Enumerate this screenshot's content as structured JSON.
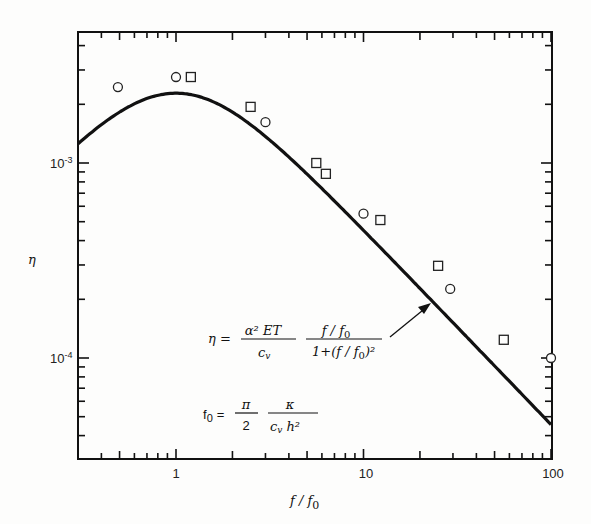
{
  "chart_data": {
    "type": "scatter",
    "title": "",
    "xlabel": "f / f0",
    "ylabel": "η",
    "xscale": "log",
    "yscale": "log",
    "xlim": [
      0.3,
      100
    ],
    "ylim": [
      3e-05,
      0.0047
    ],
    "x_tick_labels": [
      "1",
      "10",
      "100"
    ],
    "y_tick_labels": [
      "10^-3",
      "10^-4"
    ],
    "grid": false,
    "legend": null,
    "series": [
      {
        "name": "circles",
        "marker": "circle",
        "x": [
          0.49,
          1.0,
          3.0,
          10,
          29,
          100
        ],
        "y": [
          0.00245,
          0.00276,
          0.00162,
          0.00055,
          0.000226,
          0.0001
        ]
      },
      {
        "name": "squares",
        "marker": "square",
        "x": [
          1.2,
          2.5,
          5.6,
          6.3,
          12.3,
          25,
          56
        ],
        "y": [
          0.00276,
          0.00194,
          0.001,
          0.00088,
          0.00051,
          0.000297,
          0.000124
        ]
      },
      {
        "name": "theory",
        "type": "line",
        "formula": "η = (α² E T / c_v) · (f/f0) / (1 + (f/f0)²)",
        "peak": {
          "x": 1,
          "y": 0.00228
        }
      }
    ],
    "annotations": [
      {
        "text": "η = (α² E T / c_v) · (f/f0)/(1+(f/f0)²)",
        "arrow_to": {
          "x": 23,
          "y": 0.00019
        }
      },
      {
        "text": "f0 = (π/2) · κ/(c_v h²)"
      }
    ]
  },
  "labels": {
    "x_axis": "f / f",
    "x_axis_sub": "0",
    "y_axis": "η",
    "xt1": "1",
    "xt10": "10",
    "xt100": "100",
    "yt3": "10",
    "yt3exp": "-3",
    "yt4": "10",
    "yt4exp": "-4"
  },
  "equation1": {
    "lhs": "η =",
    "num1": "α² ET",
    "den1": "c",
    "den1_sub": "v",
    "num2": "f / f",
    "num2_sub": "0",
    "den2": "1+(f / f",
    "den2_sub": "0",
    "den2_tail": ")²"
  },
  "equation2": {
    "lhs": "f",
    "lhs_sub": "0",
    "eq": "=",
    "num1": "π",
    "den1": "2",
    "num2": "κ",
    "den2": "c",
    "den2_sub": "v",
    "den2_tail": "h²"
  }
}
